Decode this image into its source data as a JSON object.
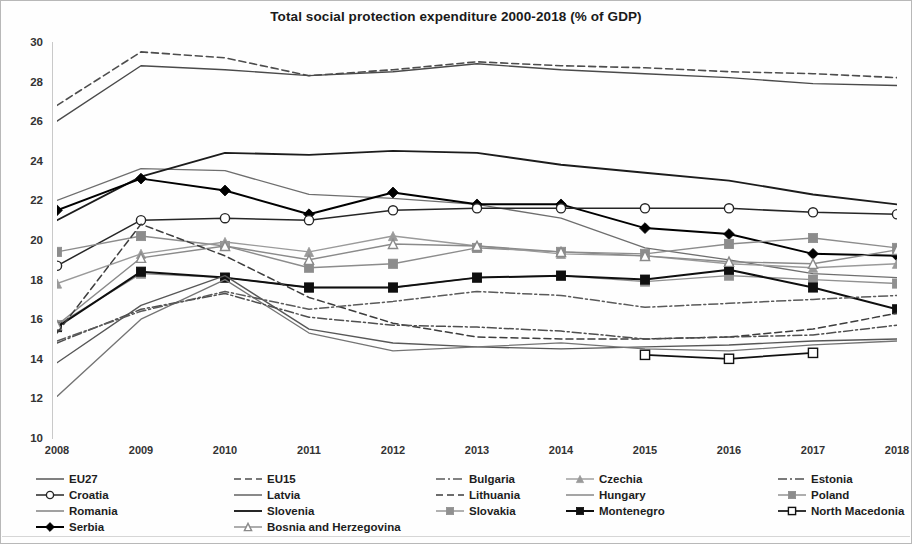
{
  "title": "Total social protection expenditure 2000-2018 (% of GDP)",
  "axes": {
    "y_ticks": [
      "30",
      "28",
      "26",
      "24",
      "22",
      "20",
      "18",
      "16",
      "14",
      "12",
      "10"
    ],
    "x_ticks": [
      "2008",
      "2009",
      "2010",
      "2011",
      "2012",
      "2013",
      "2014",
      "2015",
      "2016",
      "2017",
      "2018"
    ]
  },
  "legend": {
    "items": [
      {
        "label": "EU27",
        "marker": "none-icon"
      },
      {
        "label": "EU15",
        "marker": "none-icon"
      },
      {
        "label": "Bulgaria",
        "marker": "none-icon"
      },
      {
        "label": "Czechia",
        "marker": "triangle-icon"
      },
      {
        "label": "Estonia",
        "marker": "none-icon"
      },
      {
        "label": "Croatia",
        "marker": "circle-open-icon"
      },
      {
        "label": "Latvia",
        "marker": "none-icon"
      },
      {
        "label": "Lithuania",
        "marker": "none-icon"
      },
      {
        "label": "Hungary",
        "marker": "none-icon"
      },
      {
        "label": "Poland",
        "marker": "square-icon"
      },
      {
        "label": "Romania",
        "marker": "none-icon"
      },
      {
        "label": "Slovenia",
        "marker": "none-icon"
      },
      {
        "label": "Slovakia",
        "marker": "square-icon"
      },
      {
        "label": "Montenegro",
        "marker": "square-filled-icon"
      },
      {
        "label": "North Macedonia",
        "marker": "square-open-icon"
      },
      {
        "label": "Serbia",
        "marker": "diamond-filled-icon"
      },
      {
        "label": "Bosnia and Herzegovina",
        "marker": "triangle-open-icon"
      }
    ]
  },
  "chart_data": {
    "type": "line",
    "title": "Total social protection expenditure 2000-2018 (% of GDP)",
    "xlabel": "",
    "ylabel": "",
    "x": [
      2008,
      2009,
      2010,
      2011,
      2012,
      2013,
      2014,
      2015,
      2016,
      2017,
      2018
    ],
    "xlim": [
      2008,
      2018
    ],
    "ylim": [
      10,
      30
    ],
    "ytick_step": 2,
    "grid": false,
    "legend_position": "bottom",
    "series": [
      {
        "name": "EU15",
        "style": "dashed",
        "color": "#4d4d4d",
        "width": 1.6,
        "marker": "none",
        "values": [
          26.8,
          29.5,
          29.2,
          28.3,
          28.6,
          29.0,
          28.8,
          28.7,
          28.5,
          28.4,
          28.2
        ]
      },
      {
        "name": "EU27",
        "style": "solid",
        "color": "#4a4a4a",
        "width": 1.4,
        "marker": "none",
        "values": [
          26.0,
          28.8,
          28.6,
          28.3,
          28.5,
          28.9,
          28.6,
          28.4,
          28.2,
          27.9,
          27.8
        ]
      },
      {
        "name": "Romania",
        "style": "solid",
        "color": "#6e6e6e",
        "width": 1.3,
        "marker": "none",
        "values": [
          22.0,
          23.6,
          23.5,
          22.3,
          22.1,
          21.8,
          21.1,
          19.6,
          19.0,
          18.3,
          18.1
        ]
      },
      {
        "name": "Slovenia",
        "style": "solid",
        "color": "#1c1c1c",
        "width": 1.9,
        "marker": "none",
        "values": [
          21.0,
          23.2,
          24.4,
          24.3,
          24.5,
          24.4,
          23.8,
          23.4,
          23.0,
          22.3,
          21.8
        ]
      },
      {
        "name": "Serbia",
        "style": "solid",
        "color": "#000000",
        "width": 2.0,
        "marker": "diamond-filled",
        "values": [
          21.5,
          23.1,
          22.5,
          21.3,
          22.4,
          21.8,
          21.8,
          20.6,
          20.3,
          19.3,
          19.2
        ]
      },
      {
        "name": "Croatia",
        "style": "solid",
        "color": "#262626",
        "width": 1.5,
        "marker": "circle-open",
        "values": [
          18.7,
          21.0,
          21.1,
          21.0,
          21.5,
          21.6,
          21.6,
          21.6,
          21.6,
          21.4,
          21.3
        ]
      },
      {
        "name": "Poland",
        "style": "solid",
        "color": "#8c8c8c",
        "width": 1.4,
        "marker": "square",
        "values": [
          19.4,
          20.2,
          19.7,
          18.6,
          18.8,
          19.6,
          19.4,
          19.3,
          19.8,
          20.1,
          19.6
        ]
      },
      {
        "name": "Czechia",
        "style": "solid",
        "color": "#9a9a9a",
        "width": 1.4,
        "marker": "triangle",
        "values": [
          17.8,
          19.3,
          19.9,
          19.4,
          20.2,
          19.7,
          19.3,
          19.2,
          18.8,
          18.6,
          18.8
        ]
      },
      {
        "name": "Slovakia",
        "style": "solid",
        "color": "#909090",
        "width": 1.4,
        "marker": "square",
        "values": [
          15.7,
          18.3,
          18.1,
          17.6,
          17.6,
          18.1,
          18.2,
          17.9,
          18.2,
          18.0,
          17.8
        ]
      },
      {
        "name": "Montenegro",
        "style": "solid",
        "color": "#0f0f0f",
        "width": 2.0,
        "marker": "square-filled",
        "values": [
          15.6,
          18.4,
          18.1,
          17.6,
          17.6,
          18.1,
          18.2,
          18.0,
          18.5,
          17.6,
          16.5
        ]
      },
      {
        "name": "Bosnia and Herzegovina",
        "style": "solid",
        "color": "#8a8a8a",
        "width": 1.4,
        "marker": "triangle-open",
        "values": [
          15.7,
          19.1,
          19.7,
          19.0,
          19.8,
          19.7,
          19.4,
          19.2,
          18.9,
          18.8,
          19.5
        ]
      },
      {
        "name": "Lithuania",
        "style": "dashed",
        "color": "#3d3d3d",
        "width": 1.5,
        "marker": "none",
        "values": [
          15.3,
          20.8,
          19.2,
          17.1,
          15.8,
          15.1,
          15.0,
          15.0,
          15.1,
          15.5,
          16.3
        ]
      },
      {
        "name": "Latvia",
        "style": "solid",
        "color": "#575757",
        "width": 1.4,
        "marker": "none",
        "values": [
          13.8,
          16.7,
          18.2,
          15.5,
          14.8,
          14.6,
          14.5,
          14.6,
          14.7,
          14.9,
          15.0
        ]
      },
      {
        "name": "Hungary",
        "style": "solid",
        "color": "#747474",
        "width": 1.3,
        "marker": "none",
        "values": [
          12.1,
          16.0,
          18.0,
          15.3,
          14.4,
          14.6,
          14.8,
          14.5,
          14.4,
          14.7,
          14.9
        ]
      },
      {
        "name": "Estonia",
        "style": "dashdot",
        "color": "#4f4f4f",
        "width": 1.5,
        "marker": "none",
        "values": [
          14.8,
          16.5,
          17.3,
          16.1,
          15.7,
          15.6,
          15.4,
          15.0,
          15.1,
          15.2,
          15.7
        ]
      },
      {
        "name": "Bulgaria",
        "style": "dashdot",
        "color": "#5a5a5a",
        "width": 1.5,
        "marker": "none",
        "values": [
          14.9,
          16.4,
          17.4,
          16.5,
          16.9,
          17.4,
          17.2,
          16.6,
          16.8,
          17.0,
          17.2
        ]
      },
      {
        "name": "North Macedonia",
        "style": "solid",
        "color": "#111111",
        "width": 1.7,
        "marker": "square-open",
        "values": [
          null,
          null,
          null,
          null,
          null,
          null,
          null,
          14.2,
          14.0,
          14.3,
          null
        ]
      }
    ]
  }
}
